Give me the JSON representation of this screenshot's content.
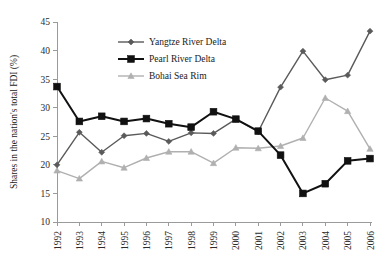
{
  "chart_data": {
    "type": "line",
    "title": "",
    "xlabel": "",
    "ylabel": "Shares  in the nation's total FDI (%)",
    "categories": [
      "1992",
      "1993",
      "1994",
      "1995",
      "1996",
      "1997",
      "1998",
      "1999",
      "2000",
      "2001",
      "2002",
      "2003",
      "2004",
      "2005",
      "2006"
    ],
    "x": [
      1992,
      1993,
      1994,
      1995,
      1996,
      1997,
      1998,
      1999,
      2000,
      2001,
      2002,
      2003,
      2004,
      2005,
      2006
    ],
    "ylim": [
      10,
      45
    ],
    "yticks": [
      10,
      15,
      20,
      25,
      30,
      35,
      40,
      45
    ],
    "ytick_labels": [
      "10",
      "15",
      "20",
      "25",
      "30",
      "35",
      "40",
      "45"
    ],
    "grid": false,
    "legend_position": "upper-left-inside",
    "series": [
      {
        "name": "Yangtze River Delta",
        "color": "#5a5a5a",
        "marker": "diamond",
        "values": [
          20.0,
          25.7,
          22.2,
          25.1,
          25.5,
          24.1,
          25.6,
          25.5,
          28.0,
          25.8,
          33.6,
          39.9,
          34.9,
          35.7,
          43.4
        ]
      },
      {
        "name": "Pearl River Delta",
        "color": "#111111",
        "marker": "square",
        "values": [
          33.7,
          27.6,
          28.5,
          27.6,
          28.1,
          27.2,
          26.6,
          29.3,
          28.0,
          25.9,
          21.7,
          15.0,
          16.7,
          20.7,
          21.1
        ]
      },
      {
        "name": "Bohai Sea Rim",
        "color": "#b0b0b0",
        "marker": "triangle",
        "values": [
          19.0,
          17.6,
          20.6,
          19.5,
          21.2,
          22.3,
          22.3,
          20.3,
          23.0,
          22.9,
          23.3,
          24.7,
          31.7,
          29.4,
          22.8
        ]
      }
    ]
  },
  "legend": {
    "items": [
      {
        "label": "Yangtze River Delta"
      },
      {
        "label": "Pearl River Delta"
      },
      {
        "label": "Bohai Sea Rim"
      }
    ]
  },
  "colors": {
    "yangtze": "#5a5a5a",
    "pearl": "#111111",
    "bohai": "#b0b0b0",
    "axis": "#9a9a9a",
    "text": "#1a1a1a",
    "background": "#ffffff"
  }
}
